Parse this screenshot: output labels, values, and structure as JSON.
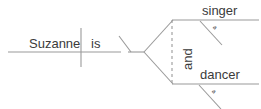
{
  "diagram": {
    "type": "reed-kellogg-sentence-diagram",
    "sentence": "Suzanne is a singer and a dancer.",
    "stroke_color": "#9a9a9a",
    "text_color": "#3b3b3b",
    "background_color": "#ffffff",
    "subject": {
      "word": "Suzanne",
      "role": "subject"
    },
    "verb": {
      "word": "is",
      "role": "linking-verb"
    },
    "conjunction": {
      "word": "and",
      "role": "coordinating-conjunction",
      "orientation": "vertical"
    },
    "complements": [
      {
        "word": "singer",
        "role": "predicate-nominative",
        "article": {
          "word": "a",
          "role": "article-modifier"
        }
      },
      {
        "word": "dancer",
        "role": "predicate-nominative",
        "article": {
          "word": "a",
          "role": "article-modifier"
        }
      }
    ]
  }
}
